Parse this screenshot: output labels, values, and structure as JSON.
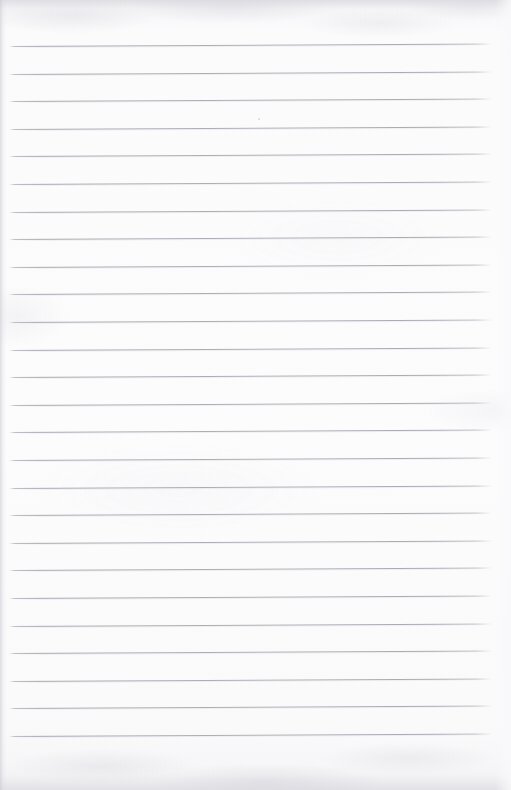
{
  "document": {
    "kind": "scanned-ruled-paper",
    "title": "Blank lined notepad page",
    "content_text": "",
    "page_width": 511,
    "page_height": 790
  },
  "appearance": {
    "paper_color": "#fbfbfc",
    "paper_edge_color": "#f1f1f3",
    "rule_color": "#a8a8b0",
    "rule_halo_color": "#d0d0d6",
    "background_color": "#ffffff"
  },
  "ruling": {
    "line_count": 26,
    "first_line_y": 46,
    "last_line_y": 736,
    "line_spacing": 27.6,
    "line_thickness": 1,
    "line_start_x": 9,
    "line_end_x": 492,
    "skew_degrees": -0.3,
    "top_margin": 46,
    "bottom_margin": 54,
    "left_margin": 9,
    "right_margin": 19
  },
  "marks": [
    {
      "name": "paper-speck",
      "x": 258,
      "y": 118,
      "size": 2
    }
  ]
}
